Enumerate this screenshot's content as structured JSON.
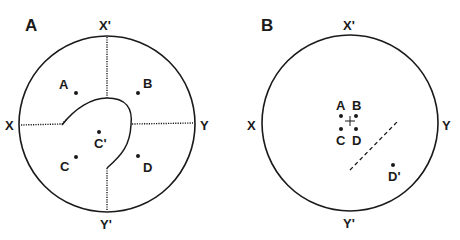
{
  "panels": [
    {
      "label": "A",
      "axes": {
        "top": "X'",
        "bottom": "Y'",
        "left": "X",
        "right": "Y"
      },
      "points": [
        {
          "label": "A"
        },
        {
          "label": "B"
        },
        {
          "label": "C"
        },
        {
          "label": "D"
        },
        {
          "label": "C'"
        }
      ]
    },
    {
      "label": "B",
      "axes": {
        "top": "X'",
        "bottom": "Y'",
        "left": "X",
        "right": "Y"
      },
      "points": [
        {
          "label": "A"
        },
        {
          "label": "B"
        },
        {
          "label": "C"
        },
        {
          "label": "D"
        },
        {
          "label": "D'"
        }
      ]
    }
  ]
}
